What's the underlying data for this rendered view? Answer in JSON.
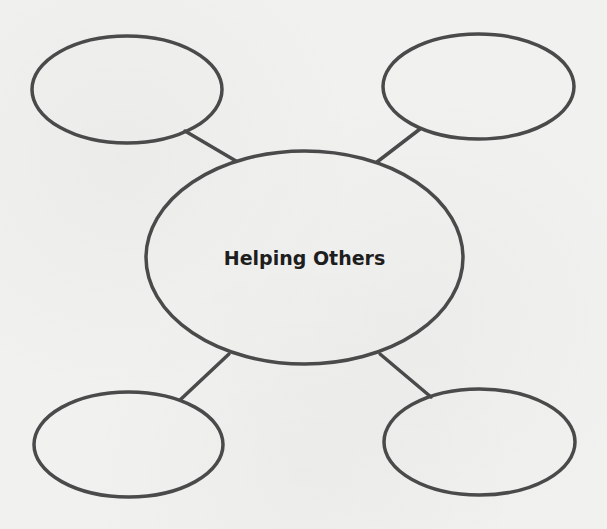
{
  "diagram": {
    "type": "web-organizer",
    "style": {
      "stroke_color": "#4a4a4a",
      "background_color": "#f1f1f0",
      "text_color": "#1e1e1e"
    },
    "center": {
      "label": "Helping Others"
    },
    "branches": [
      {
        "position": "top-left",
        "label": ""
      },
      {
        "position": "top-right",
        "label": ""
      },
      {
        "position": "bottom-left",
        "label": ""
      },
      {
        "position": "bottom-right",
        "label": ""
      }
    ]
  }
}
